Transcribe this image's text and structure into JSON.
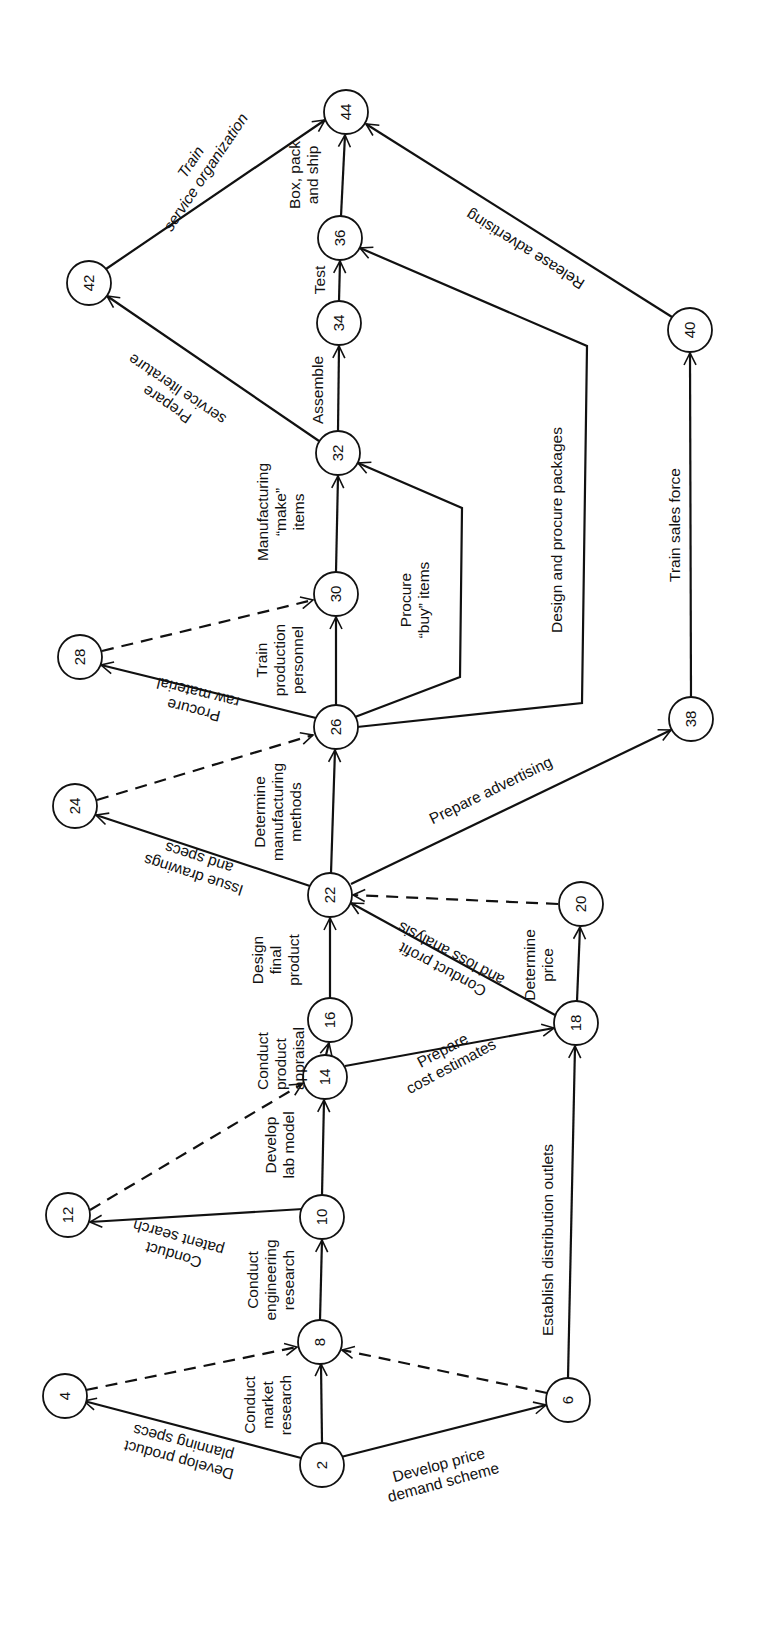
{
  "diagram": {
    "type": "PERT activity-on-arrow network",
    "orientation": "rotated 90 degrees counter-clockwise",
    "nodes": [
      {
        "id": "2",
        "x": 322,
        "y": 1465
      },
      {
        "id": "4",
        "x": 65,
        "y": 1396
      },
      {
        "id": "6",
        "x": 568,
        "y": 1400
      },
      {
        "id": "8",
        "x": 320,
        "y": 1342
      },
      {
        "id": "10",
        "x": 322,
        "y": 1217
      },
      {
        "id": "12",
        "x": 68,
        "y": 1215
      },
      {
        "id": "14",
        "x": 325,
        "y": 1077
      },
      {
        "id": "16",
        "x": 330,
        "y": 1020
      },
      {
        "id": "18",
        "x": 576,
        "y": 1023
      },
      {
        "id": "20",
        "x": 581,
        "y": 904
      },
      {
        "id": "22",
        "x": 330,
        "y": 895
      },
      {
        "id": "24",
        "x": 75,
        "y": 806
      },
      {
        "id": "26",
        "x": 336,
        "y": 727
      },
      {
        "id": "28",
        "x": 80,
        "y": 657
      },
      {
        "id": "30",
        "x": 336,
        "y": 594
      },
      {
        "id": "32",
        "x": 338,
        "y": 453
      },
      {
        "id": "34",
        "x": 339,
        "y": 323
      },
      {
        "id": "36",
        "x": 340,
        "y": 238
      },
      {
        "id": "38",
        "x": 691,
        "y": 719
      },
      {
        "id": "40",
        "x": 690,
        "y": 330
      },
      {
        "id": "42",
        "x": 89,
        "y": 283
      },
      {
        "id": "44",
        "x": 346,
        "y": 112
      }
    ],
    "activities": [
      {
        "from": "2",
        "to": "4",
        "label": "Develop product planning specs",
        "dummy": false
      },
      {
        "from": "2",
        "to": "8",
        "label": "Conduct market research",
        "dummy": false
      },
      {
        "from": "2",
        "to": "6",
        "label": "Develop price demand scheme",
        "dummy": false
      },
      {
        "from": "4",
        "to": "8",
        "label": "",
        "dummy": true
      },
      {
        "from": "6",
        "to": "8",
        "label": "",
        "dummy": true
      },
      {
        "from": "6",
        "to": "18",
        "label": "Establish distribution outlets",
        "dummy": false
      },
      {
        "from": "8",
        "to": "10",
        "label": "Conduct engineering research",
        "dummy": false
      },
      {
        "from": "10",
        "to": "12",
        "label": "Conduct patent search",
        "dummy": false
      },
      {
        "from": "10",
        "to": "14",
        "label": "Develop lab model",
        "dummy": false
      },
      {
        "from": "12",
        "to": "14",
        "label": "",
        "dummy": true
      },
      {
        "from": "14",
        "to": "16",
        "label": "Conduct product appraisal",
        "dummy": false
      },
      {
        "from": "14",
        "to": "18",
        "label": "Prepare cost estimates",
        "dummy": false
      },
      {
        "from": "16",
        "to": "22",
        "label": "Design final product",
        "dummy": false
      },
      {
        "from": "18",
        "to": "22",
        "label": "Conduct profit and loss analysis",
        "dummy": false
      },
      {
        "from": "18",
        "to": "20",
        "label": "Determine price",
        "dummy": false
      },
      {
        "from": "20",
        "to": "22",
        "label": "",
        "dummy": true
      },
      {
        "from": "22",
        "to": "24",
        "label": "Issue drawings and specs",
        "dummy": false
      },
      {
        "from": "22",
        "to": "26",
        "label": "Determine manufacturing methods",
        "dummy": false
      },
      {
        "from": "22",
        "to": "38",
        "label": "Prepare advertising",
        "dummy": false
      },
      {
        "from": "24",
        "to": "26",
        "label": "",
        "dummy": true
      },
      {
        "from": "26",
        "to": "28",
        "label": "Procure raw material",
        "dummy": false
      },
      {
        "from": "26",
        "to": "30",
        "label": "Train production personnel",
        "dummy": false
      },
      {
        "from": "26",
        "to": "32",
        "label": "Procure \"buy\" items",
        "dummy": false
      },
      {
        "from": "26",
        "to": "36",
        "label": "Design and procure packages",
        "dummy": false
      },
      {
        "from": "28",
        "to": "30",
        "label": "",
        "dummy": true
      },
      {
        "from": "30",
        "to": "32",
        "label": "Manufacturing \"make\" items",
        "dummy": false
      },
      {
        "from": "32",
        "to": "34",
        "label": "Assemble",
        "dummy": false
      },
      {
        "from": "32",
        "to": "42",
        "label": "Prepare service literature",
        "dummy": false
      },
      {
        "from": "34",
        "to": "36",
        "label": "Test",
        "dummy": false
      },
      {
        "from": "36",
        "to": "44",
        "label": "Box, pack and ship",
        "dummy": false
      },
      {
        "from": "38",
        "to": "40",
        "label": "Train sales force",
        "dummy": false
      },
      {
        "from": "40",
        "to": "44",
        "label": "Release advertising",
        "dummy": false
      },
      {
        "from": "42",
        "to": "44",
        "label": "Train service organization",
        "dummy": false
      }
    ],
    "labels": {
      "a_2_4": [
        "Develop product",
        "planning specs"
      ],
      "a_2_8": [
        "Conduct",
        "market",
        "research"
      ],
      "a_2_6": [
        "Develop price",
        "demand scheme"
      ],
      "a_6_18": [
        "Establish distribution outlets"
      ],
      "a_8_10": [
        "Conduct",
        "engineering",
        "research"
      ],
      "a_10_12": [
        "Conduct",
        "patent search"
      ],
      "a_10_14": [
        "Develop",
        "lab model"
      ],
      "a_14_16": [
        "Conduct",
        "product",
        "appraisal"
      ],
      "a_14_18": [
        "Prepare",
        "cost estimates"
      ],
      "a_16_22": [
        "Design",
        "final",
        "product"
      ],
      "a_18_22": [
        "Conduct profit",
        "and loss analysis"
      ],
      "a_18_20": [
        "Determine",
        "price"
      ],
      "a_22_24": [
        "Issue drawings",
        "and specs"
      ],
      "a_22_26": [
        "Determine",
        "manufacturing",
        "methods"
      ],
      "a_22_38": [
        "Prepare advertising"
      ],
      "a_26_28": [
        "Procure",
        "raw material"
      ],
      "a_26_30": [
        "Train",
        "production",
        "personnel"
      ],
      "a_26_32": [
        "Procure",
        "“buy” items"
      ],
      "a_26_36": [
        "Design and procure packages"
      ],
      "a_30_32": [
        "Manufacturing",
        "“make”",
        "items"
      ],
      "a_32_34": [
        "Assemble"
      ],
      "a_32_42": [
        "Prepare",
        "service literature"
      ],
      "a_34_36": [
        "Test"
      ],
      "a_36_44": [
        "Box, pack",
        "and ship"
      ],
      "a_38_40": [
        "Train sales force"
      ],
      "a_40_44": [
        "Release advertising"
      ],
      "a_42_44": [
        "Train",
        "service organization"
      ]
    }
  }
}
